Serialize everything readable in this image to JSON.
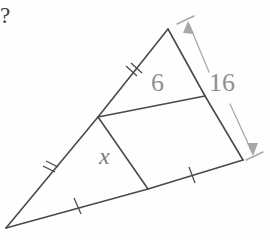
{
  "figure": {
    "type": "geometry-diagram",
    "background_color": "#fefefe",
    "stroke_color": "#4a4a4a",
    "dimension_color": "#a8a8a8",
    "label_color": "#8f8f8f"
  },
  "labels": {
    "question_mark": "?",
    "midsegment_length": "6",
    "right_side_length": "16",
    "unknown_length": "x"
  },
  "geometry": {
    "vertices": {
      "apex": [
        168,
        29
      ],
      "left": [
        6,
        228
      ],
      "right": [
        243,
        160
      ]
    },
    "midpoints": {
      "left_side_midpoint": [
        98,
        117
      ],
      "right_side_midpoint": [
        205,
        96
      ],
      "base_midpoint": [
        148,
        189
      ]
    },
    "dimension_arrow": {
      "top": [
        190,
        23
      ],
      "bottom": [
        254,
        151
      ]
    }
  },
  "tick_marks": [
    {
      "name": "upper-left-double-tick",
      "position": [
        133,
        73
      ],
      "count": 2
    },
    {
      "name": "lower-left-double-tick",
      "position": [
        50,
        170
      ],
      "count": 2
    },
    {
      "name": "base-left-single-tick",
      "position": [
        78,
        206
      ],
      "count": 1
    },
    {
      "name": "base-right-single-tick",
      "position": [
        192,
        175
      ],
      "count": 1
    }
  ]
}
